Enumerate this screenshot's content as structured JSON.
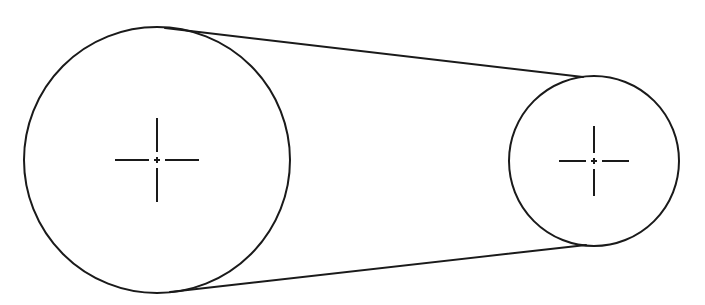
{
  "figure": {
    "type": "engineering-line-drawing",
    "background_color": "#ffffff",
    "line_color": "#1a1a1a",
    "stroke_width": 2,
    "canvas": {
      "width": 705,
      "height": 305
    }
  },
  "pulleys": [
    {
      "id": "large-pulley",
      "label": "Large pulley",
      "center_x": 157,
      "center_y": 160,
      "radius": 133,
      "diameter": 266,
      "bounds": {
        "left": 24,
        "right": 290,
        "top": 27,
        "bottom": 293
      }
    },
    {
      "id": "small-pulley",
      "label": "Small pulley",
      "center_x": 594,
      "center_y": 161,
      "radius": 85,
      "diameter": 170,
      "bounds": {
        "left": 509,
        "right": 679,
        "top": 76,
        "bottom": 246
      }
    }
  ],
  "belt": {
    "label": "Belt",
    "type": "open-belt-external-tangents",
    "upper_tangent": {
      "x1": 165,
      "y1": 28,
      "x2": 583,
      "y2": 77
    },
    "lower_tangent": {
      "x1": 170,
      "y1": 292,
      "x2": 586,
      "y2": 245
    }
  },
  "centerlines": [
    {
      "id": "large-pulley-centermark",
      "label": "Centre mark — large pulley",
      "center_x": 157,
      "center_y": 160,
      "arm_length": 42,
      "style": "dash-dot"
    },
    {
      "id": "small-pulley-centermark",
      "label": "Centre mark — small pulley",
      "center_x": 594,
      "center_y": 161,
      "arm_length": 35,
      "style": "dash-dot"
    }
  ]
}
